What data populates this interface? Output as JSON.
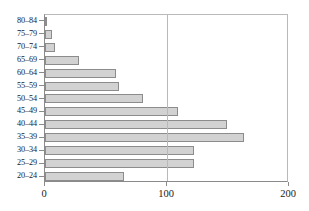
{
  "chart_data": {
    "type": "bar",
    "orientation": "horizontal",
    "title": "",
    "subtitle": "",
    "xlabel": "",
    "ylabel": "",
    "categories": [
      "80–84",
      "75–79",
      "70–74",
      "65–69",
      "60–64",
      "55–59",
      "50–54",
      "45–49",
      "40–44",
      "35–39",
      "30–34",
      "25–29",
      "20–24"
    ],
    "values": [
      2,
      6,
      8,
      28,
      58,
      61,
      80,
      109,
      149,
      163,
      122,
      122,
      65
    ],
    "xlim": [
      0,
      200
    ],
    "xticks": [
      0,
      100,
      200
    ],
    "xticklabels": [
      "0",
      "100",
      "200"
    ],
    "grid": "vertical-at-100",
    "legend": null,
    "bar_fill_color": "#d2d2d2",
    "bar_border_color": "#8c8c8c",
    "axis_color": "#8a8a8a",
    "gridline_color": "#b9b9b9",
    "background_color": "#ffffff"
  }
}
